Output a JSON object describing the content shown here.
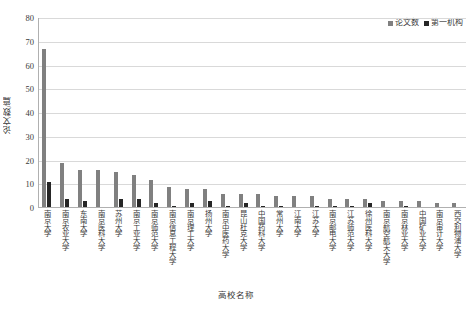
{
  "chart_data": {
    "type": "bar",
    "title": "",
    "xlabel": "高校名称",
    "ylabel": "论文数/篇",
    "ylim": [
      0,
      80
    ],
    "yticks": [
      80,
      70,
      60,
      50,
      40,
      30,
      20,
      10,
      0
    ],
    "grid": true,
    "legend_position": "top-right",
    "categories": [
      "南京大学",
      "南京农业大学",
      "东南大学",
      "南京医科大学",
      "苏州大学",
      "南京工业大学",
      "南京师范大学",
      "南京信息工程大学",
      "南京理工大学",
      "扬州大学",
      "南京中医药大学",
      "昆山杜克大学",
      "中国药科大学",
      "常州大学",
      "江南大学",
      "江苏大学",
      "南京邮电大学",
      "江苏师范大学",
      "徐州医科大学",
      "南京航空航天大学",
      "南京林业大学",
      "中国矿业大学",
      "南京审计大学",
      "西交利物浦大学"
    ],
    "series": [
      {
        "name": "论文数",
        "color": "#808080",
        "values": [
          67,
          19,
          16,
          16,
          15,
          14,
          12,
          9,
          8,
          8,
          6,
          6,
          6,
          5,
          5,
          5,
          4,
          4,
          4,
          3,
          3,
          3,
          2,
          2
        ]
      },
      {
        "name": "第一机构",
        "color": "#262626",
        "values": [
          11,
          4,
          3,
          0,
          4,
          4,
          2,
          1,
          2,
          3,
          1,
          2,
          1,
          1,
          0,
          1,
          1,
          1,
          2,
          0,
          1,
          0,
          0,
          0
        ]
      }
    ]
  },
  "legend": {
    "entries": [
      {
        "label": "论文数"
      },
      {
        "label": "第一机构"
      }
    ]
  },
  "axes": {
    "y_title": "论文数/篇",
    "x_title": "高校名称"
  },
  "colors": {
    "series_1": "#808080",
    "series_2": "#262626",
    "gridline": "#d9d9d9",
    "axis": "#b0b0b0",
    "text": "#3a3a3a",
    "background": "#ffffff"
  }
}
